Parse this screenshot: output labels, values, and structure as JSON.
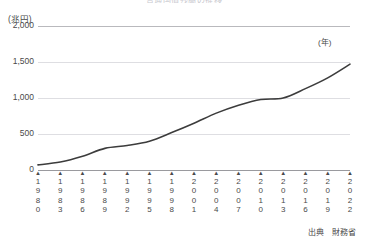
{
  "chart_title": "普通国債残高の推移",
  "y_unit_label": "(兆円)",
  "x_unit_label": "(年)",
  "source_note": "出典　財務省",
  "tick_marker_glyph": "▲",
  "colors": {
    "line": "#3c3c3c",
    "grid": "#dedee2",
    "axis": "#9a9a9e",
    "text": "#4a4a4a"
  },
  "chart_data": {
    "type": "line",
    "title": "普通国債残高の推移",
    "xlabel": "(年)",
    "ylabel": "(兆円)",
    "ylim": [
      0,
      2000
    ],
    "yticks": [
      0,
      500,
      1000,
      1500,
      2000
    ],
    "ytick_labels": [
      "0",
      "500",
      "1,000",
      "1,500",
      "2,000"
    ],
    "xlim": [
      1980,
      2022
    ],
    "xticks": [
      1980,
      1983,
      1986,
      1989,
      1992,
      1995,
      1998,
      2001,
      2004,
      2007,
      2010,
      2013,
      2016,
      2019,
      2022
    ],
    "xtick_labels": [
      "1980",
      "1983",
      "1986",
      "1989",
      "1992",
      "1995",
      "1998",
      "2001",
      "2004",
      "2007",
      "2010",
      "2013",
      "2016",
      "2019",
      "2022"
    ],
    "grid": true,
    "legend": "none",
    "series": [
      {
        "name": "普通国債残高",
        "x": [
          1980,
          1981,
          1982,
          1983,
          1984,
          1985,
          1986,
          1987,
          1988,
          1989,
          1990,
          1991,
          1992,
          1993,
          1994,
          1995,
          1996,
          1997,
          1998,
          1999,
          2000,
          2001,
          2002,
          2003,
          2004,
          2005,
          2006,
          2007,
          2008,
          2009,
          2010,
          2011,
          2012,
          2013,
          2014,
          2015,
          2016,
          2017,
          2018,
          2019,
          2020,
          2021,
          2022
        ],
        "values": [
          71,
          82,
          96,
          110,
          122,
          134,
          145,
          152,
          157,
          160,
          166,
          172,
          178,
          193,
          207,
          225,
          245,
          258,
          295,
          332,
          368,
          392,
          421,
          457,
          499,
          527,
          532,
          541,
          546,
          594,
          636,
          670,
          705,
          744,
          774,
          805,
          831,
          853,
          874,
          887,
          947,
          991,
          1029
        ],
        "values_display_note": "Later values plotted on same scale; final point ≈1,470",
        "style": "solid",
        "color": "#3c3c3c"
      }
    ],
    "plotted_points": [
      {
        "x": 1980,
        "y": 71
      },
      {
        "x": 1983,
        "y": 110
      },
      {
        "x": 1986,
        "y": 190
      },
      {
        "x": 1989,
        "y": 300
      },
      {
        "x": 1992,
        "y": 340
      },
      {
        "x": 1995,
        "y": 400
      },
      {
        "x": 1998,
        "y": 520
      },
      {
        "x": 2001,
        "y": 650
      },
      {
        "x": 2004,
        "y": 790
      },
      {
        "x": 2007,
        "y": 900
      },
      {
        "x": 2010,
        "y": 980
      },
      {
        "x": 2013,
        "y": 1000
      },
      {
        "x": 2016,
        "y": 1130
      },
      {
        "x": 2019,
        "y": 1280
      },
      {
        "x": 2022,
        "y": 1470
      }
    ]
  }
}
